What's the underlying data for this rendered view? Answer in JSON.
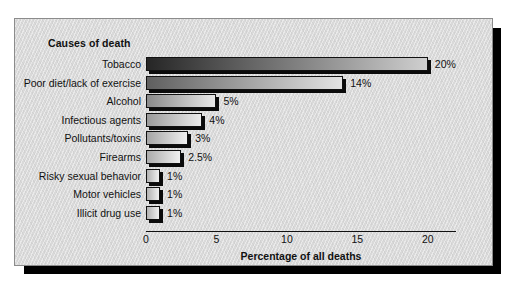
{
  "chart_data": {
    "type": "bar",
    "orientation": "horizontal",
    "title": "Causes of death",
    "xlabel": "Percentage of all deaths",
    "ylabel": "",
    "categories": [
      "Tobacco",
      "Poor diet/lack of exercise",
      "Alcohol",
      "Infectious agents",
      "Pollutants/toxins",
      "Firearms",
      "Risky sexual behavior",
      "Motor vehicles",
      "Illicit drug use"
    ],
    "values": [
      20,
      14,
      5,
      4,
      3,
      2.5,
      1,
      1,
      1
    ],
    "data_labels": [
      "20%",
      "14%",
      "5%",
      "4%",
      "3%",
      "2.5%",
      "1%",
      "1%",
      "1%"
    ],
    "xlim": [
      0,
      22
    ],
    "xticks": [
      0,
      5,
      10,
      15,
      20
    ],
    "xtick_labels": [
      "0",
      "5",
      "10",
      "15",
      "20"
    ],
    "grid": false,
    "legend": null,
    "bar_fill": "gradient-gray",
    "bar_colors": [
      {
        "from": "#262626",
        "to": "#cfcfcf"
      },
      {
        "from": "#5f5f5f",
        "to": "#e3e3e3"
      },
      {
        "from": "#8a8a8a",
        "to": "#e8e8e8"
      },
      {
        "from": "#9a9a9a",
        "to": "#ececec"
      },
      {
        "from": "#a5a5a5",
        "to": "#efefef"
      },
      {
        "from": "#ababab",
        "to": "#f0f0f0"
      },
      {
        "from": "#b2b2b2",
        "to": "#f2f2f2"
      },
      {
        "from": "#b2b2b2",
        "to": "#f2f2f2"
      },
      {
        "from": "#b2b2b2",
        "to": "#f2f2f2"
      }
    ]
  },
  "colors": {
    "panel_background": "#d9d9d9",
    "panel_border": "#8c8c8c",
    "shadow": "#000000",
    "text": "#111111",
    "axis": "#111111"
  }
}
